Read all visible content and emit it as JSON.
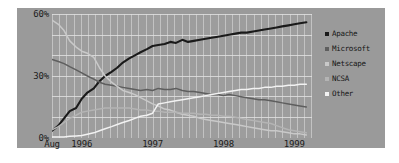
{
  "chart_data": {
    "type": "line",
    "title": "",
    "subtitle": "",
    "xlabel": "",
    "ylabel": "",
    "grid": true,
    "legend_position": "right",
    "xlim": [
      1995.58,
      1999.25
    ],
    "ylim": [
      0,
      60
    ],
    "y_ticks": [
      0,
      30,
      60
    ],
    "y_ticklabels": [
      "0%",
      "30%",
      "60%"
    ],
    "x_ticks": [
      1995.58,
      1996.0,
      1997.0,
      1998.0,
      1999.0
    ],
    "x_ticklabels": [
      "Aug",
      "1996",
      "1997",
      "1998",
      "1999"
    ],
    "colors": {
      "apache": "#1a1a1a",
      "microsoft": "#5e5e5e",
      "netscape": "#c9c9c9",
      "ncsa": "#b4b4b4",
      "other": "#f2f2f2",
      "plot_background": "#9d9d9d",
      "panel_background": "#9a9a9a",
      "gridline": "#e6e6e6",
      "text": "#1c1c1c"
    },
    "x": [
      1995.58,
      1995.67,
      1995.75,
      1995.83,
      1995.92,
      1996.0,
      1996.08,
      1996.17,
      1996.25,
      1996.33,
      1996.42,
      1996.5,
      1996.58,
      1996.67,
      1996.75,
      1996.83,
      1996.92,
      1997.0,
      1997.08,
      1997.17,
      1997.25,
      1997.33,
      1997.42,
      1997.5,
      1997.58,
      1997.67,
      1997.75,
      1997.83,
      1997.92,
      1998.0,
      1998.08,
      1998.17,
      1998.25,
      1998.33,
      1998.42,
      1998.5,
      1998.58,
      1998.67,
      1998.75,
      1998.83,
      1998.92,
      1999.0,
      1999.08,
      1999.17
    ],
    "series": [
      {
        "name": "Apache",
        "color": "#1a1a1a",
        "values": [
          3.5,
          6.0,
          9.5,
          13.0,
          14.5,
          19.0,
          22.0,
          24.0,
          27.5,
          30.0,
          32.0,
          34.0,
          36.5,
          38.5,
          40.0,
          41.5,
          43.0,
          44.5,
          45.0,
          45.5,
          46.5,
          46.0,
          47.5,
          46.5,
          47.0,
          47.5,
          48.0,
          48.5,
          49.0,
          49.5,
          50.0,
          50.5,
          51.0,
          51.0,
          51.5,
          52.0,
          52.5,
          53.0,
          53.5,
          54.0,
          54.5,
          55.0,
          55.5,
          56.0
        ]
      },
      {
        "name": "Microsoft",
        "color": "#5e5e5e",
        "values": [
          38.0,
          37.0,
          36.0,
          34.5,
          33.0,
          31.5,
          30.0,
          28.5,
          27.0,
          26.0,
          25.5,
          25.0,
          24.5,
          24.0,
          23.5,
          23.0,
          23.5,
          23.0,
          24.0,
          23.5,
          23.5,
          24.0,
          23.0,
          22.5,
          22.5,
          22.0,
          21.5,
          21.0,
          21.0,
          20.5,
          21.0,
          20.5,
          20.0,
          19.5,
          19.0,
          18.5,
          18.5,
          18.0,
          17.5,
          17.0,
          16.5,
          16.0,
          15.5,
          15.0
        ]
      },
      {
        "name": "Netscape",
        "color": "#c9c9c9",
        "values": [
          57.0,
          55.0,
          52.0,
          47.0,
          44.0,
          42.0,
          41.0,
          39.0,
          34.0,
          30.0,
          27.0,
          25.0,
          23.0,
          22.0,
          21.0,
          19.5,
          18.0,
          16.5,
          15.5,
          14.0,
          13.5,
          12.5,
          11.5,
          11.0,
          10.5,
          9.5,
          9.0,
          8.5,
          8.0,
          7.5,
          7.0,
          6.5,
          6.0,
          5.5,
          5.0,
          4.5,
          4.0,
          3.5,
          3.5,
          3.0,
          2.5,
          2.0,
          2.0,
          1.5
        ]
      },
      {
        "name": "NCSA",
        "color": "#b4b4b4",
        "values": [
          4.0,
          5.5,
          7.5,
          9.5,
          11.0,
          12.5,
          13.0,
          13.5,
          14.0,
          14.5,
          14.5,
          14.5,
          14.5,
          14.5,
          14.0,
          13.5,
          13.5,
          13.0,
          13.0,
          12.5,
          12.5,
          12.5,
          12.0,
          12.0,
          12.0,
          11.5,
          11.5,
          11.0,
          11.0,
          10.5,
          10.5,
          10.0,
          9.5,
          9.0,
          8.5,
          8.0,
          7.5,
          7.0,
          6.0,
          5.0,
          4.0,
          3.5,
          3.0,
          2.5
        ]
      },
      {
        "name": "Other",
        "color": "#f2f2f2",
        "values": [
          0.5,
          0.5,
          0.5,
          0.8,
          1.0,
          1.2,
          1.8,
          2.5,
          3.5,
          4.5,
          5.5,
          6.5,
          7.5,
          8.5,
          9.5,
          10.5,
          11.0,
          12.0,
          16.5,
          17.0,
          17.5,
          18.0,
          18.5,
          19.0,
          19.5,
          20.0,
          20.5,
          21.0,
          21.5,
          22.0,
          22.5,
          23.0,
          23.5,
          23.5,
          24.0,
          24.0,
          24.5,
          24.5,
          25.0,
          25.0,
          25.5,
          25.5,
          26.0,
          26.0
        ]
      }
    ]
  },
  "axes": {
    "y_labels": [
      {
        "text": "60%",
        "value": 60
      },
      {
        "text": "30%",
        "value": 30
      },
      {
        "text": "0%",
        "value": 0
      }
    ],
    "x_labels": [
      {
        "text": "Aug",
        "value": 1995.58
      },
      {
        "text": "1996",
        "value": 1996.0
      },
      {
        "text": "1997",
        "value": 1997.0
      },
      {
        "text": "1998",
        "value": 1998.0
      },
      {
        "text": "1999",
        "value": 1999.0
      }
    ]
  },
  "legend": {
    "items": [
      {
        "label": "Apache",
        "color": "#1a1a1a"
      },
      {
        "label": "Microsoft",
        "color": "#5e5e5e"
      },
      {
        "label": "Netscape",
        "color": "#c9c9c9"
      },
      {
        "label": "NCSA",
        "color": "#b4b4b4"
      },
      {
        "label": "Other",
        "color": "#f2f2f2"
      }
    ]
  }
}
